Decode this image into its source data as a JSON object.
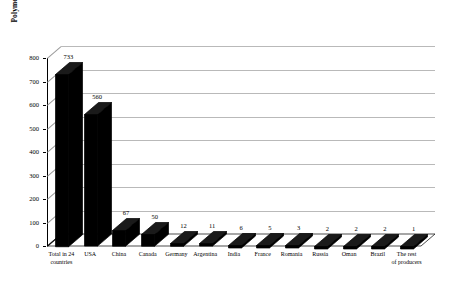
{
  "chart_data": {
    "type": "bar",
    "title": "",
    "xlabel": "",
    "ylabel": "Polymer flooding projects",
    "ylim": [
      0,
      800
    ],
    "ytick_step": 100,
    "yticks": [
      "0",
      "100",
      "200",
      "300",
      "400",
      "500",
      "600",
      "700",
      "800"
    ],
    "grid": true,
    "legend": "none",
    "style": "3d-perspective-column",
    "bar_color": "#000000",
    "gridline_color": "#b9b9b9",
    "background": "#ffffff",
    "categories": [
      "Total in 24\ncountries",
      "USA",
      "China",
      "Canada",
      "Germany",
      "Argentina",
      "India",
      "France",
      "Romania",
      "Russia",
      "Oman",
      "Brazil",
      "The rest\nof producers"
    ],
    "values": [
      733,
      560,
      67,
      50,
      12,
      11,
      6,
      5,
      3,
      2,
      2,
      2,
      1
    ],
    "value_labels": [
      "733",
      "560",
      "67",
      "50",
      "12",
      "11",
      "6",
      "5",
      "3",
      "2",
      "2",
      "2",
      "1"
    ]
  }
}
